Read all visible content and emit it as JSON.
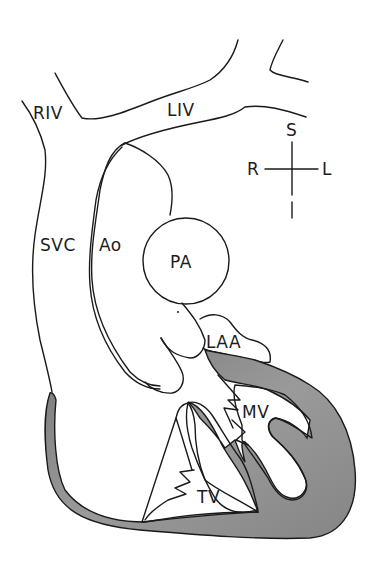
{
  "diagram": {
    "type": "anatomical cross-section of the heart and great vessels",
    "labels": {
      "riv": "RIV",
      "liv": "LIV",
      "svc": "SVC",
      "ao": "Ao",
      "pa": "PA",
      "laa": "LAA",
      "mv": "MV",
      "tv": "TV"
    },
    "orientation": {
      "superior": "S",
      "inferior": "I",
      "right": "R",
      "left": "L"
    },
    "colors": {
      "line": "#1a1a1a",
      "myocardium": "#8a8a8a",
      "myocardium_dark": "#6e6e6e",
      "background": "#ffffff"
    }
  }
}
